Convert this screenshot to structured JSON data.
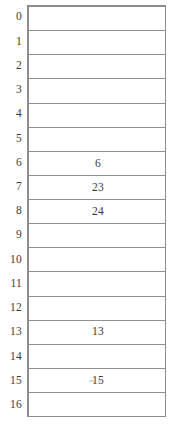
{
  "figure": {
    "type": "indexed-row-table",
    "row_count": 17,
    "index_range": [
      0,
      16
    ],
    "border_color": "#8c8c8c",
    "grid_line_color": "#909090",
    "text_color": "#39393b",
    "background_color": "#ffffff"
  },
  "rows": [
    {
      "index": "0",
      "value": ""
    },
    {
      "index": "1",
      "value": ""
    },
    {
      "index": "2",
      "value": ""
    },
    {
      "index": "3",
      "value": ""
    },
    {
      "index": "4",
      "value": ""
    },
    {
      "index": "5",
      "value": ""
    },
    {
      "index": "6",
      "value": "6"
    },
    {
      "index": "7",
      "value": "23"
    },
    {
      "index": "8",
      "value": "24"
    },
    {
      "index": "9",
      "value": ""
    },
    {
      "index": "10",
      "value": ""
    },
    {
      "index": "11",
      "value": ""
    },
    {
      "index": "12",
      "value": ""
    },
    {
      "index": "13",
      "value": "13"
    },
    {
      "index": "14",
      "value": ""
    },
    {
      "index": "15",
      "value": "15"
    },
    {
      "index": "16",
      "value": ""
    }
  ]
}
